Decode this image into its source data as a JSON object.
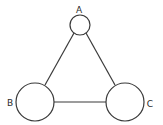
{
  "diagram": {
    "type": "graph",
    "nodes": [
      {
        "id": "A",
        "label": "A",
        "cx": 80,
        "cy": 25,
        "r": 10,
        "label_x": 79,
        "label_y": 13
      },
      {
        "id": "B",
        "label": "B",
        "cx": 35,
        "cy": 102,
        "r": 19,
        "label_x": 10,
        "label_y": 106
      },
      {
        "id": "C",
        "label": "C",
        "cx": 125,
        "cy": 102,
        "r": 19,
        "label_x": 150,
        "label_y": 107
      }
    ],
    "edges": [
      {
        "from": "A",
        "to": "B",
        "x1": 74,
        "y1": 33,
        "x2": 45,
        "y2": 85
      },
      {
        "from": "A",
        "to": "C",
        "x1": 86,
        "y1": 33,
        "x2": 115,
        "y2": 85
      },
      {
        "from": "B",
        "to": "C",
        "x1": 54,
        "y1": 102,
        "x2": 106,
        "y2": 102
      }
    ],
    "colors": {
      "stroke": "#3a3a3a",
      "fill": "#ffffff",
      "text": "#2a2a2a"
    }
  }
}
